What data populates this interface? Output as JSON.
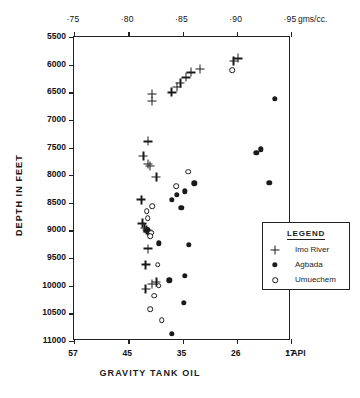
{
  "chart_data": {
    "type": "scatter",
    "title": "",
    "xlabel": "GRAVITY  TANK  OIL",
    "ylabel": "DEPTH  IN  FEET",
    "top_axis": {
      "label": "gms/cc.",
      "ticks": [
        "·75",
        "·80",
        "·85",
        "·90",
        "·95"
      ],
      "values": [
        0.75,
        0.8,
        0.85,
        0.9,
        0.95
      ],
      "range": [
        0.75,
        0.95
      ]
    },
    "bottom_axis": {
      "ticks": [
        "57",
        "45",
        "35",
        "26",
        "17"
      ],
      "values": [
        57,
        45,
        35,
        26,
        17
      ],
      "suffix": "° API",
      "range": [
        57,
        17
      ],
      "note": "API gravity decreases left to right, inverse of density"
    },
    "yaxis": {
      "ticks": [
        "5500",
        "6000",
        "6500",
        "7000",
        "7500",
        "8000",
        "8500",
        "9000",
        "9500",
        "10000",
        "10500",
        "11000"
      ],
      "values": [
        5500,
        6000,
        6500,
        7000,
        7500,
        8000,
        8500,
        9000,
        9500,
        10000,
        10500,
        11000
      ],
      "ylim": [
        5500,
        11000
      ],
      "direction": "increasing-downward"
    },
    "grid": false,
    "legend": {
      "title": "LEGEND",
      "position": "inside-lower-right",
      "entries": [
        {
          "marker": "plus",
          "label": "Imo  River"
        },
        {
          "marker": "filled-circle",
          "label": "Agbada"
        },
        {
          "marker": "open-circle",
          "label": "Umuechem"
        }
      ]
    },
    "series": [
      {
        "name": "Imo  River",
        "marker": "plus",
        "points": [
          {
            "density": 0.822,
            "depth": 6660
          },
          {
            "density": 0.822,
            "depth": 6530
          },
          {
            "density": 0.84,
            "depth": 6500
          },
          {
            "density": 0.845,
            "depth": 6400
          },
          {
            "density": 0.848,
            "depth": 6330
          },
          {
            "density": 0.853,
            "depth": 6230
          },
          {
            "density": 0.858,
            "depth": 6140
          },
          {
            "density": 0.866,
            "depth": 6080
          },
          {
            "density": 0.897,
            "depth": 5930
          },
          {
            "density": 0.901,
            "depth": 5885
          },
          {
            "density": 0.818,
            "depth": 7390
          },
          {
            "density": 0.814,
            "depth": 7650
          },
          {
            "density": 0.818,
            "depth": 7800
          },
          {
            "density": 0.82,
            "depth": 7830
          },
          {
            "density": 0.826,
            "depth": 8030
          },
          {
            "density": 0.812,
            "depth": 8440
          },
          {
            "density": 0.813,
            "depth": 8870
          },
          {
            "density": 0.815,
            "depth": 8960
          },
          {
            "density": 0.817,
            "depth": 8990
          },
          {
            "density": 0.818,
            "depth": 9020
          },
          {
            "density": 0.818,
            "depth": 9330
          },
          {
            "density": 0.816,
            "depth": 9620
          },
          {
            "density": 0.822,
            "depth": 9970
          },
          {
            "density": 0.826,
            "depth": 9930
          },
          {
            "density": 0.816,
            "depth": 10060
          }
        ]
      },
      {
        "name": "Agbada",
        "marker": "filled-circle",
        "points": [
          {
            "density": 0.935,
            "depth": 6620
          },
          {
            "density": 0.918,
            "depth": 7600
          },
          {
            "density": 0.922,
            "depth": 7530
          },
          {
            "density": 0.93,
            "depth": 8140
          },
          {
            "density": 0.861,
            "depth": 8150
          },
          {
            "density": 0.852,
            "depth": 8290
          },
          {
            "density": 0.845,
            "depth": 8360
          },
          {
            "density": 0.84,
            "depth": 8450
          },
          {
            "density": 0.849,
            "depth": 8590
          },
          {
            "density": 0.818,
            "depth": 9000
          },
          {
            "density": 0.82,
            "depth": 9060
          },
          {
            "density": 0.828,
            "depth": 9230
          },
          {
            "density": 0.856,
            "depth": 9260
          },
          {
            "density": 0.838,
            "depth": 9900
          },
          {
            "density": 0.852,
            "depth": 9820
          },
          {
            "density": 0.851,
            "depth": 10310
          },
          {
            "density": 0.84,
            "depth": 10870
          }
        ]
      },
      {
        "name": "Umuechem",
        "marker": "open-circle",
        "points": [
          {
            "density": 0.896,
            "depth": 6100
          },
          {
            "density": 0.855,
            "depth": 7940
          },
          {
            "density": 0.844,
            "depth": 8200
          },
          {
            "density": 0.817,
            "depth": 8650
          },
          {
            "density": 0.818,
            "depth": 8780
          },
          {
            "density": 0.821,
            "depth": 9040
          },
          {
            "density": 0.82,
            "depth": 9100
          },
          {
            "density": 0.822,
            "depth": 8560
          },
          {
            "density": 0.827,
            "depth": 9620
          },
          {
            "density": 0.828,
            "depth": 10000
          },
          {
            "density": 0.824,
            "depth": 10180
          },
          {
            "density": 0.82,
            "depth": 10420
          },
          {
            "density": 0.831,
            "depth": 10620
          }
        ]
      }
    ]
  }
}
